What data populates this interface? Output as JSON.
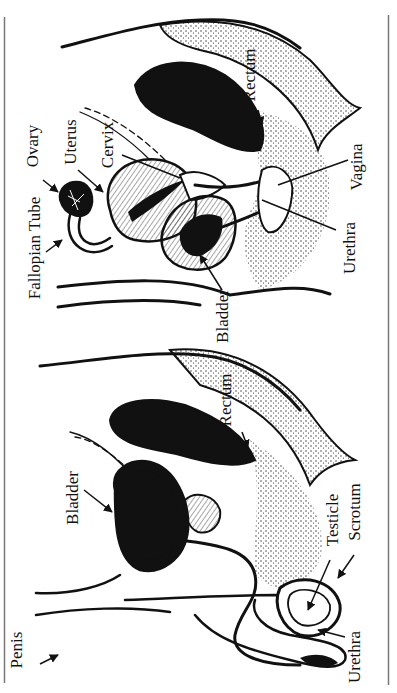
{
  "diagram": {
    "type": "anatomical cross-section",
    "orientation": "rotated 90deg counterclockwise",
    "colors": {
      "ink": "#111111",
      "background": "#ffffff",
      "border": "#777777"
    },
    "panels": [
      {
        "id": "female",
        "labels": {
          "fallopian_tube": "Fallopian Tube",
          "ovary": "Ovary",
          "uterus": "Uterus",
          "cervix": "Cervix",
          "bladder": "Bladder",
          "rectum": "Rectum",
          "vagina": "Vagina",
          "urethra": "Urethra"
        }
      },
      {
        "id": "male",
        "labels": {
          "bladder": "Bladder",
          "penis": "Penis",
          "rectum": "Rectum",
          "testicle": "Testicle",
          "scrotum": "Scrotum",
          "urethra": "Urethra"
        }
      }
    ]
  }
}
